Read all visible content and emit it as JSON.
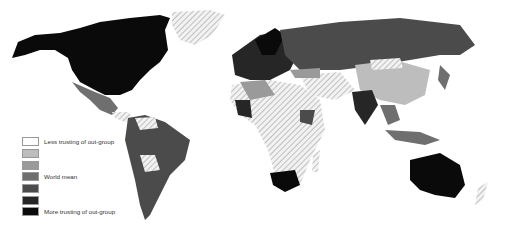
{
  "map": {
    "title": "",
    "type": "choropleth",
    "projection": "world",
    "no_data_pattern": "diagonal-hatch",
    "legend": {
      "items": [
        {
          "label": "Less trusting of out-group",
          "color": "#ffffff"
        },
        {
          "label": "",
          "color": "#bdbdbd"
        },
        {
          "label": "",
          "color": "#9a9a9a"
        },
        {
          "label": "World mean",
          "color": "#6f6f6f"
        },
        {
          "label": "",
          "color": "#4b4b4b"
        },
        {
          "label": "",
          "color": "#262626"
        },
        {
          "label": "More trusting of out-group",
          "color": "#0a0a0a"
        }
      ]
    },
    "colors": {
      "ocean": "#ffffff",
      "hatch": "#bdbdbd",
      "border": "#ffffff"
    }
  }
}
